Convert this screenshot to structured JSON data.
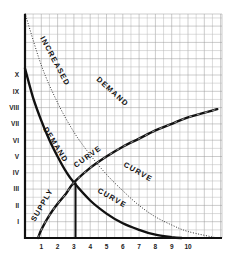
{
  "chart_data": {
    "type": "line",
    "title": "",
    "xlabel": "",
    "ylabel": "",
    "x_ticks": [
      "1",
      "2",
      "3",
      "4",
      "5",
      "6",
      "7",
      "8",
      "9",
      "10"
    ],
    "y_ticks": [
      "I",
      "II",
      "III",
      "IV",
      "V",
      "VI",
      "VII",
      "VIII",
      "IX",
      "X"
    ],
    "xlim": [
      0,
      11.8
    ],
    "ylim": [
      0,
      13.9
    ],
    "grid": true,
    "series": [
      {
        "name": "Demand Curve",
        "style": "solid-thick",
        "x": [
          0,
          0.5,
          1,
          1.5,
          2,
          2.5,
          3,
          4,
          5,
          6,
          7,
          8,
          9,
          9.6
        ],
        "y": [
          10.4,
          8.6,
          7.2,
          6.0,
          5.0,
          4.1,
          3.4,
          2.3,
          1.5,
          0.9,
          0.5,
          0.2,
          0.05,
          0
        ]
      },
      {
        "name": "Supply Curve",
        "style": "solid-thick-hatched",
        "x": [
          0.8,
          1,
          1.5,
          2,
          2.5,
          3,
          4,
          5,
          6,
          7,
          8,
          9,
          10,
          11.8
        ],
        "y": [
          0,
          0.5,
          1.4,
          2.1,
          2.7,
          3.4,
          4.3,
          5.0,
          5.6,
          6.1,
          6.6,
          7.0,
          7.4,
          7.9
        ]
      },
      {
        "name": "Increased Demand Curve",
        "style": "dotted",
        "x": [
          0,
          1,
          2,
          3,
          4,
          5,
          6,
          7,
          8,
          9,
          10,
          11.8
        ],
        "y": [
          13.8,
          10.6,
          8.3,
          6.5,
          5.1,
          3.9,
          2.9,
          2.0,
          1.3,
          0.8,
          0.4,
          0
        ]
      }
    ],
    "annotations": [
      {
        "text": "INCREASED",
        "along": "Increased Demand Curve"
      },
      {
        "text": "DEMAND",
        "along": "Increased Demand Curve"
      },
      {
        "text": "CURVE",
        "along": "Increased Demand Curve"
      },
      {
        "text": "DEMAND",
        "along": "Demand Curve"
      },
      {
        "text": "CURVE",
        "along": "Demand Curve"
      },
      {
        "text": "SUPPLY",
        "along": "Supply Curve"
      },
      {
        "text": "CURVE",
        "along": "Supply Curve"
      },
      {
        "type": "vertical-line",
        "x": 3.1,
        "from_y": 0,
        "to_y": 3.4,
        "note": "equilibrium quantity"
      }
    ],
    "equilibrium": {
      "x": 3.1,
      "y": 3.4
    }
  },
  "labels": {
    "increased": "INCREASED",
    "demand_upper": "DEMAND",
    "curve_upper": "CURVE",
    "demand_lower": "DEMAND",
    "curve_lower": "CURVE",
    "supply": "SUPPLY",
    "curve_supply": "CURVE"
  }
}
